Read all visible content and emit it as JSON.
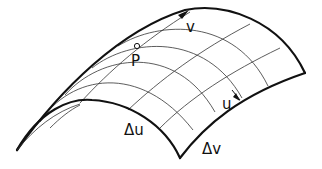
{
  "diagram": {
    "type": "parametric-surface-patch",
    "labels": {
      "v": "v",
      "u": "u",
      "point": "P",
      "delta_u": "Δu",
      "delta_v": "Δv"
    },
    "colors": {
      "stroke": "#111111",
      "grid": "#333333",
      "background": "#ffffff"
    }
  }
}
